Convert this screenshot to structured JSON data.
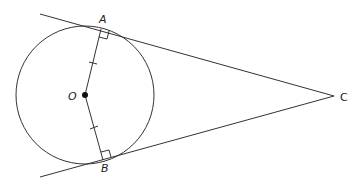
{
  "diagram": {
    "type": "geometry",
    "labels": {
      "A": "A",
      "B": "B",
      "O": "O",
      "C": "C"
    },
    "points": {
      "O": [
        85,
        95
      ],
      "A": [
        101,
        29
      ],
      "B": [
        103,
        160
      ],
      "C": [
        334,
        96
      ]
    },
    "circle": {
      "center": "O",
      "radius": 69
    },
    "segments": [
      "OA",
      "OB",
      "AC",
      "BC"
    ],
    "markings": {
      "congruent_ticks": [
        "OA",
        "OB"
      ],
      "right_angles": [
        "A",
        "B"
      ]
    },
    "colors": {
      "stroke": "#333333",
      "label": "#222222",
      "background": "#ffffff"
    }
  }
}
